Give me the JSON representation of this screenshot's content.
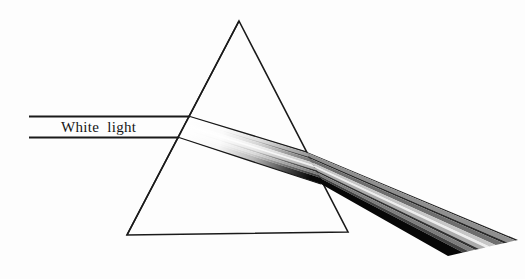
{
  "canvas": {
    "width": 525,
    "height": 279,
    "background": "#fdfdfd"
  },
  "line_color": "#1a1a1a",
  "label": {
    "text": "White light",
    "x": 61,
    "y": 132
  },
  "prism": {
    "apex": [
      239,
      21
    ],
    "bottom_left": [
      127,
      235
    ],
    "bottom_right": [
      348,
      232
    ]
  },
  "incident_rays": [
    {
      "x1": 29,
      "y1": 116.5,
      "x2": 190,
      "y2": 116.5
    },
    {
      "x1": 29,
      "y1": 137.5,
      "x2": 179,
      "y2": 137.5
    }
  ],
  "beam": {
    "entry_edge": [
      [
        190,
        116.5
      ],
      [
        179,
        137.5
      ]
    ],
    "exit_edge": [
      [
        307,
        152
      ],
      [
        321,
        184
      ]
    ],
    "end_edge": [
      [
        518,
        240
      ],
      [
        448,
        256
      ]
    ],
    "stripes": [
      {
        "name": "top-edge",
        "from": 0.0,
        "to": 0.035,
        "color": "#222222"
      },
      {
        "name": "band-1",
        "from": 0.035,
        "to": 0.15,
        "color": "#8f8f8f"
      },
      {
        "name": "band-2",
        "from": 0.15,
        "to": 0.205,
        "color": "#2a2a2a"
      },
      {
        "name": "band-3",
        "from": 0.205,
        "to": 0.32,
        "color": "#6e6e6e"
      },
      {
        "name": "band-4",
        "from": 0.32,
        "to": 0.41,
        "color": "#c6c6c6"
      },
      {
        "name": "band-5",
        "from": 0.41,
        "to": 0.465,
        "color": "#eeeeee"
      },
      {
        "name": "band-6",
        "from": 0.465,
        "to": 0.555,
        "color": "#ababab"
      },
      {
        "name": "band-7",
        "from": 0.555,
        "to": 0.615,
        "color": "#323232"
      },
      {
        "name": "band-8",
        "from": 0.615,
        "to": 0.705,
        "color": "#7d7d7d"
      },
      {
        "name": "band-9",
        "from": 0.705,
        "to": 0.785,
        "color": "#414141"
      },
      {
        "name": "band-10",
        "from": 0.785,
        "to": 1.0,
        "color": "#070707"
      }
    ],
    "entry_fade_stops": [
      [
        0,
        1
      ],
      [
        0.28,
        0.97
      ],
      [
        0.55,
        0.72
      ],
      [
        0.8,
        0.28
      ],
      [
        1,
        0
      ]
    ]
  }
}
